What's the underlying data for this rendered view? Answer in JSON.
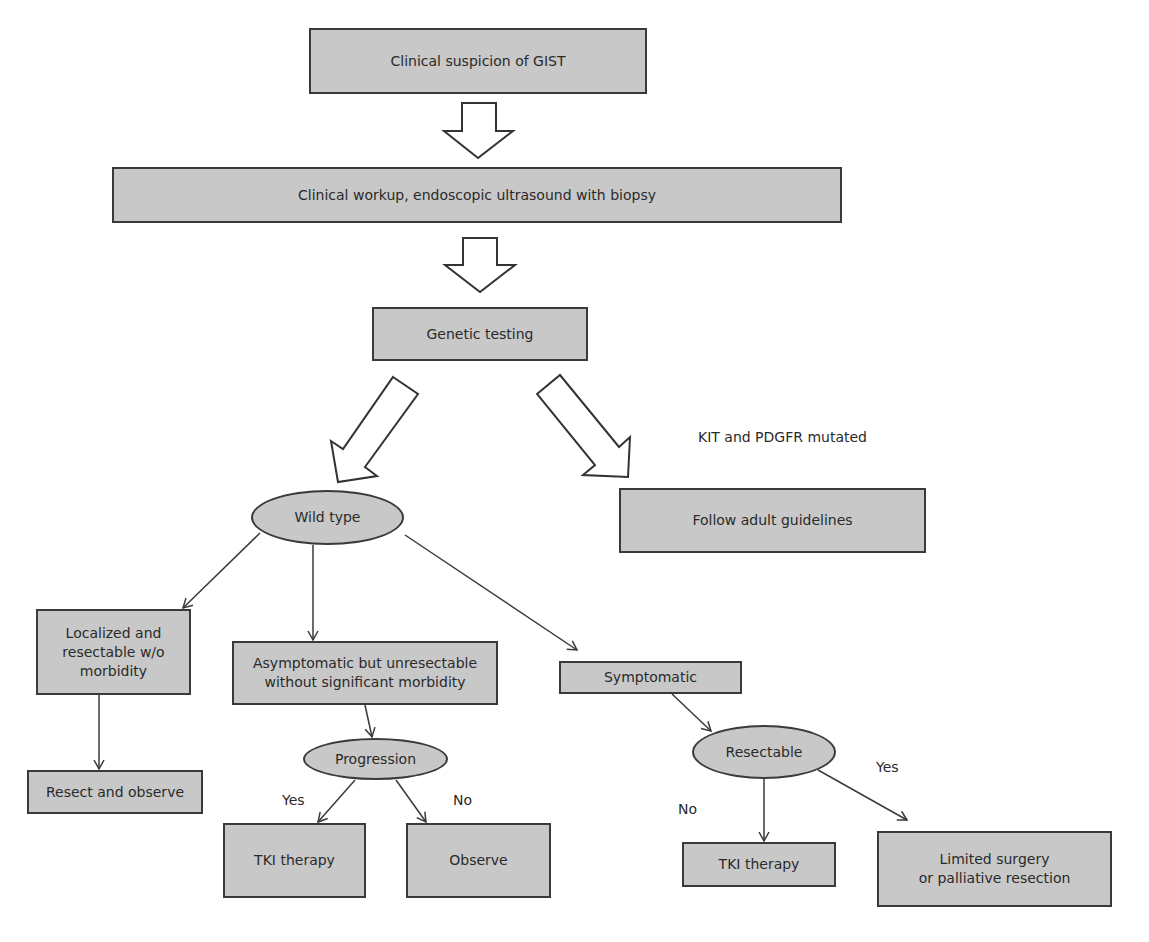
{
  "diagram": {
    "type": "flowchart",
    "nodes": {
      "suspicion": "Clinical suspicion of GIST",
      "workup": "Clinical workup, endoscopic ultrasound with biopsy",
      "genetic": "Genetic testing",
      "wild_type": "Wild type",
      "follow_adult": "Follow adult guidelines",
      "localized": "Localized and\nresectable w/o\nmorbidity",
      "asymptomatic": "Asymptomatic but unresectable\nwithout significant morbidity",
      "symptomatic": "Symptomatic",
      "resect_observe": "Resect and observe",
      "progression": "Progression",
      "tki_1": "TKI therapy",
      "observe": "Observe",
      "resectable": "Resectable",
      "tki_2": "TKI therapy",
      "limited_surgery": "Limited surgery\nor palliative resection"
    },
    "edge_labels": {
      "mutated": "KIT and PDGFR mutated",
      "progression_yes": "Yes",
      "progression_no": "No",
      "resectable_yes": "Yes",
      "resectable_no": "No"
    },
    "colors": {
      "node_fill": "#c8c8c8",
      "node_border": "#3a3a3a",
      "line": "#3a3a3a",
      "text": "#2a2a2a"
    }
  }
}
